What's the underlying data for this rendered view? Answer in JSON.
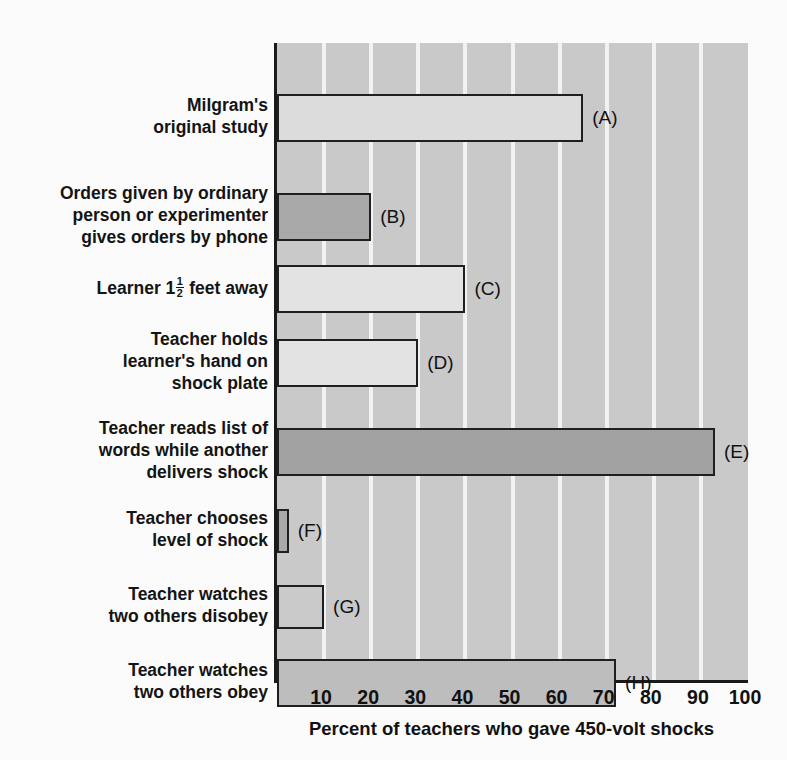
{
  "chart_data": {
    "type": "bar",
    "orientation": "horizontal",
    "title": "",
    "xlabel": "Percent of teachers who gave 450-volt shocks",
    "ylabel": "",
    "xlim": [
      0,
      100
    ],
    "xticks": [
      10,
      20,
      30,
      40,
      50,
      60,
      70,
      80,
      90,
      100
    ],
    "xticklabels": [
      "10",
      "20",
      "30",
      "40",
      "50",
      "60",
      "70",
      "80",
      "90",
      "100"
    ],
    "grid": "vertical-white-gridlines",
    "legend": "none",
    "plot_background": "#c9c9c9",
    "categories": [
      "Milgram's original study",
      "Orders given by ordinary person or experimenter gives orders by phone",
      "Learner 1 1/2 feet away",
      "Teacher holds learner's hand on shock plate",
      "Teacher reads list of words while another delivers shock",
      "Teacher chooses level of shock",
      "Teacher watches two others disobey",
      "Teacher watches two others obey"
    ],
    "values": [
      65,
      20,
      40,
      30,
      93,
      2.5,
      10,
      72
    ],
    "point_labels": [
      "(A)",
      "(B)",
      "(C)",
      "(D)",
      "(E)",
      "(F)",
      "(G)",
      "(H)"
    ],
    "bar_colors": [
      "#dcdcdc",
      "#a9a9a9",
      "#e3e3e3",
      "#e3e3e3",
      "#a2a2a2",
      "#a9a9a9",
      "#cacaca",
      "#bdbdbd"
    ]
  },
  "bars": [
    {
      "letter": "(A)",
      "value": 65,
      "color": "#dcdcdc",
      "label_lines": [
        "Milgram's",
        "original study"
      ],
      "top": 51,
      "height": 48
    },
    {
      "letter": "(B)",
      "value": 20,
      "color": "#a9a9a9",
      "label_lines": [
        "Orders given by ordinary",
        "person or experimenter",
        "gives orders by phone"
      ],
      "top": 150,
      "height": 48
    },
    {
      "letter": "(C)",
      "value": 40,
      "color": "#e3e3e3",
      "label_lines": [
        "Learner 1{FRAC} feet away"
      ],
      "top": 222,
      "height": 48
    },
    {
      "letter": "(D)",
      "value": 30,
      "color": "#e3e3e3",
      "label_lines": [
        "Teacher holds",
        "learner's hand on",
        "shock plate"
      ],
      "top": 296,
      "height": 48
    },
    {
      "letter": "(E)",
      "value": 93,
      "color": "#a2a2a2",
      "label_lines": [
        "Teacher reads list of",
        "words while another",
        "delivers shock"
      ],
      "top": 385,
      "height": 48
    },
    {
      "letter": "(F)",
      "value": 2.5,
      "color": "#a9a9a9",
      "label_lines": [
        "Teacher chooses",
        "level of shock"
      ],
      "top": 466,
      "height": 44
    },
    {
      "letter": "(G)",
      "value": 10,
      "color": "#cacaca",
      "label_lines": [
        "Teacher watches",
        "two others disobey"
      ],
      "top": 542,
      "height": 44
    },
    {
      "letter": "(H)",
      "value": 72,
      "color": "#bdbdbd",
      "label_lines": [
        "Teacher watches",
        "two others obey"
      ],
      "top": 616,
      "height": 48
    }
  ],
  "axis": {
    "title": "Percent of teachers who gave 450-volt shocks",
    "ticks": [
      "10",
      "20",
      "30",
      "40",
      "50",
      "60",
      "70",
      "80",
      "90",
      "100"
    ]
  }
}
